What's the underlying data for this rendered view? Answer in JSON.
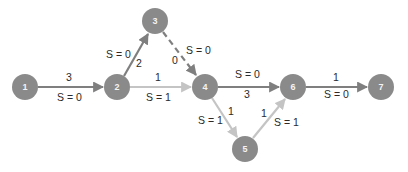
{
  "colors": {
    "node_fill": "#8a8a8a",
    "critical_edge": "#7f7f7f",
    "noncritical_edge": "#c4c4c4",
    "text": "#2a2a2a"
  },
  "nodes": [
    {
      "id": "1",
      "label": "1",
      "x": 25,
      "y": 87
    },
    {
      "id": "2",
      "label": "2",
      "x": 117,
      "y": 87
    },
    {
      "id": "3",
      "label": "3",
      "x": 155,
      "y": 21
    },
    {
      "id": "4",
      "label": "4",
      "x": 205,
      "y": 87
    },
    {
      "id": "5",
      "label": "5",
      "x": 245,
      "y": 149
    },
    {
      "id": "6",
      "label": "6",
      "x": 293,
      "y": 87
    },
    {
      "id": "7",
      "label": "7",
      "x": 381,
      "y": 87
    }
  ],
  "edges": [
    {
      "from": "1",
      "to": "2",
      "duration": "3",
      "slack": "S = 0",
      "style": "critical"
    },
    {
      "from": "2",
      "to": "3",
      "duration": "2",
      "slack": "S = 0",
      "style": "critical"
    },
    {
      "from": "3",
      "to": "4",
      "duration": "0",
      "slack": "S = 0",
      "style": "critical-dashed"
    },
    {
      "from": "2",
      "to": "4",
      "duration": "1",
      "slack": "S = 1",
      "style": "noncritical"
    },
    {
      "from": "4",
      "to": "6",
      "duration": "3",
      "slack": "S = 0",
      "style": "critical"
    },
    {
      "from": "4",
      "to": "5",
      "duration": "1",
      "slack": "S = 1",
      "style": "noncritical"
    },
    {
      "from": "5",
      "to": "6",
      "duration": "1",
      "slack": "S = 1",
      "style": "noncritical"
    },
    {
      "from": "6",
      "to": "7",
      "duration": "1",
      "slack": "S = 0",
      "style": "critical"
    }
  ]
}
